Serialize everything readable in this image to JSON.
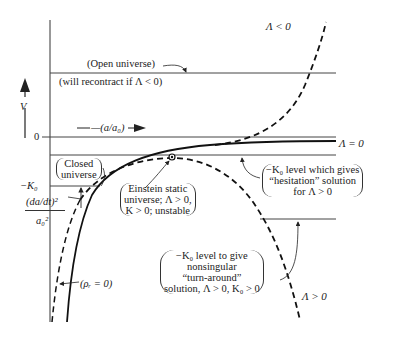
{
  "figure": {
    "y_axis_label": "V",
    "x_axis_label": "—(a/a₀)",
    "zero_tick_label": "0",
    "minus_k0_label": "−K₀",
    "y_quantity_numerator": "(da/dt)²",
    "y_quantity_denominator": "a₀²",
    "curve_labels": {
      "lambda_negative": "Λ < 0",
      "lambda_zero": "Λ = 0",
      "lambda_positive": "Λ > 0",
      "rho_r_zero": "(ρᵣ = 0)"
    },
    "annotations": {
      "open_universe_line1": "(Open universe)",
      "open_universe_line2": "(will recontract if Λ < 0)",
      "closed_universe_line1": "Closed",
      "closed_universe_line2": "universe",
      "einstein_line1": "Einstein static",
      "einstein_line2": "universe; Λ > 0,",
      "einstein_line3": "K > 0; unstable",
      "hesitation_line1": "−K₀ level which gives",
      "hesitation_line2": "“hesitation” solution",
      "hesitation_line3": "for Λ > 0",
      "turnaround_line1": "−K₀ level to give",
      "turnaround_line2": "nonsingular",
      "turnaround_line3": "“turn-around”",
      "turnaround_line4": "solution, Λ > 0, K₀ > 0"
    },
    "colors": {
      "ink": "#222222",
      "background": "#ffffff"
    }
  }
}
